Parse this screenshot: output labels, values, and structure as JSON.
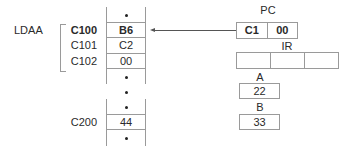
{
  "instruction": {
    "mnemonic": "LDAA"
  },
  "memory": {
    "addresses": [
      {
        "label": "C100",
        "bold": true
      },
      {
        "label": "C101",
        "bold": false
      },
      {
        "label": "C102",
        "bold": false
      },
      {
        "label": "C200",
        "bold": false
      }
    ],
    "cells": [
      {
        "type": "ellipsis",
        "value": "•"
      },
      {
        "type": "value",
        "value": "B6",
        "bold": true
      },
      {
        "type": "value",
        "value": "C2"
      },
      {
        "type": "value",
        "value": "00"
      },
      {
        "type": "ellipsis",
        "value": "•"
      },
      {
        "type": "gap",
        "value": "•"
      },
      {
        "type": "ellipsis",
        "value": "•"
      },
      {
        "type": "value",
        "value": "44"
      },
      {
        "type": "ellipsis",
        "value": "•"
      }
    ]
  },
  "registers": {
    "pc": {
      "label": "PC",
      "high": "C1",
      "low": "00"
    },
    "ir": {
      "label": "IR",
      "parts": [
        "",
        "",
        ""
      ]
    },
    "a": {
      "label": "A",
      "value": "22"
    },
    "b": {
      "label": "B",
      "value": "33"
    }
  },
  "arrow": {
    "from": "pc",
    "to": "memory-c100"
  },
  "colors": {
    "border": "#9a9a9a",
    "text": "#2a2a2a",
    "arrow": "#555555"
  }
}
